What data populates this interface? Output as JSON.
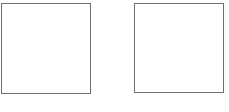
{
  "diagram": {
    "shapes": [
      {
        "id": "left",
        "type": "square",
        "label": "",
        "border_color": "#6f6f6f",
        "fill": "#ffffff"
      },
      {
        "id": "right",
        "type": "square",
        "label": "",
        "border_color": "#6f6f6f",
        "fill": "#ffffff"
      }
    ]
  }
}
